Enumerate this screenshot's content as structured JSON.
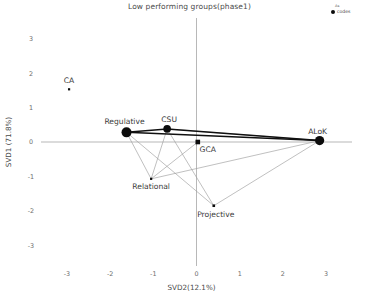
{
  "chart_data": {
    "type": "scatter",
    "title": "Low performing groups(phase1)",
    "xlabel": "SVD2(12.1%)",
    "ylabel": "SVD1 (71.8%)",
    "xlim": [
      -3.6,
      3.6
    ],
    "ylim": [
      -3.6,
      3.6
    ],
    "xticks": [
      "-3",
      "-2",
      "-1",
      "0",
      "1",
      "2",
      "3"
    ],
    "xtick_values": [
      -3,
      -2,
      -1,
      0,
      1,
      2,
      3
    ],
    "yticks": [
      "3",
      "2",
      "1",
      "0",
      "-1",
      "-2",
      "-3"
    ],
    "ytick_values": [
      3,
      2,
      1,
      0,
      -1,
      -2,
      -3
    ],
    "grid": false,
    "legend": {
      "title": "As",
      "entries": [
        {
          "label": "codes",
          "marker": "circle",
          "color": "#0b0b0b"
        }
      ],
      "position": "top-right"
    },
    "points": [
      {
        "label": "CA",
        "x": -2.95,
        "y": 1.53,
        "marker": "square",
        "size": 2.2,
        "label_dx": 0,
        "label_dy": -6
      },
      {
        "label": "Regulative",
        "x": -1.62,
        "y": 0.28,
        "marker": "circle",
        "size": 5.0,
        "label_dx": -2,
        "label_dy": -8
      },
      {
        "label": "CSU",
        "x": -0.68,
        "y": 0.38,
        "marker": "circle",
        "size": 3.8,
        "label_dx": 2,
        "label_dy": -7
      },
      {
        "label": "GCA",
        "x": 0.03,
        "y": 0.0,
        "marker": "square",
        "size": 4.6,
        "label_dx": 10,
        "label_dy": 10
      },
      {
        "label": "ALoK",
        "x": 2.85,
        "y": 0.04,
        "marker": "circle",
        "size": 4.6,
        "label_dx": -2,
        "label_dy": -7
      },
      {
        "label": "Relational",
        "x": -1.05,
        "y": -1.07,
        "marker": "square",
        "size": 2.2,
        "label_dx": 0,
        "label_dy": 10
      },
      {
        "label": "Projective",
        "x": 0.4,
        "y": -1.85,
        "marker": "square",
        "size": 2.6,
        "label_dx": 2,
        "label_dy": 11
      }
    ],
    "edges_thick": [
      {
        "from": "Regulative",
        "to": "CSU"
      },
      {
        "from": "CSU",
        "to": "ALoK"
      },
      {
        "from": "Regulative",
        "to": "ALoK"
      }
    ],
    "edges_thin": [
      {
        "from": "Regulative",
        "to": "Relational"
      },
      {
        "from": "Regulative",
        "to": "Projective"
      },
      {
        "from": "CSU",
        "to": "Relational"
      },
      {
        "from": "CSU",
        "to": "Projective"
      },
      {
        "from": "ALoK",
        "to": "Relational"
      },
      {
        "from": "ALoK",
        "to": "Projective"
      },
      {
        "from": "ALoK",
        "to": "CSU"
      },
      {
        "from": "Relational",
        "to": "GCA"
      }
    ]
  }
}
